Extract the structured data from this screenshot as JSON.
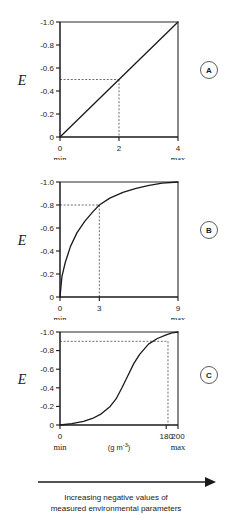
{
  "figure": {
    "y_axis_label": "E",
    "panel_badges": [
      "A",
      "B",
      "C"
    ],
    "caption_line1": "Increasing negative values of",
    "caption_line2": "measured environmental parameters",
    "arrow_icon": "right-arrow-icon"
  },
  "chart_data": [
    {
      "type": "line",
      "panel": "A",
      "title": "",
      "xlabel": "",
      "ylabel": "E",
      "relationship": "linear",
      "x": [
        0,
        0.4,
        0.8,
        1.2,
        1.6,
        2.0,
        2.4,
        2.8,
        3.2,
        3.6,
        4.0
      ],
      "values": [
        0,
        -0.1,
        -0.2,
        -0.3,
        -0.4,
        -0.5,
        -0.6,
        -0.7,
        -0.8,
        -0.9,
        -1.0
      ],
      "xlim": [
        0,
        4
      ],
      "ylim": [
        0,
        -1.0
      ],
      "x_ticks": [
        0,
        2,
        4
      ],
      "x_tick_labels": [
        "0",
        "2",
        "4"
      ],
      "x_tick_sublabels": [
        "min",
        "",
        "max"
      ],
      "y_ticks": [
        0,
        -0.2,
        -0.4,
        -0.6,
        -0.8,
        -1.0
      ],
      "y_tick_labels": [
        "0",
        "-0.2",
        "-0.4",
        "-0.6",
        "-0.8",
        "-1.0"
      ],
      "guide_x": 2,
      "guide_y": -0.5,
      "grid": false,
      "legend": "none"
    },
    {
      "type": "line",
      "panel": "B",
      "title": "",
      "xlabel": "",
      "ylabel": "E",
      "relationship": "concave-saturating",
      "x": [
        0,
        0.15,
        0.4,
        0.8,
        1.3,
        1.9,
        2.5,
        3.0,
        3.8,
        4.8,
        5.8,
        6.8,
        7.8,
        9.0
      ],
      "values": [
        0,
        -0.18,
        -0.3,
        -0.44,
        -0.56,
        -0.66,
        -0.74,
        -0.8,
        -0.86,
        -0.91,
        -0.945,
        -0.97,
        -0.99,
        -1.0
      ],
      "xlim": [
        0,
        9
      ],
      "ylim": [
        0,
        -1.0
      ],
      "x_ticks": [
        0,
        3,
        9
      ],
      "x_tick_labels": [
        "0",
        "3",
        "9"
      ],
      "x_tick_sublabels": [
        "min",
        "",
        "max"
      ],
      "y_ticks": [
        0,
        -0.2,
        -0.4,
        -0.6,
        -0.8,
        -1.0
      ],
      "y_tick_labels": [
        "0",
        "-0.2",
        "-0.4",
        "-0.6",
        "-0.8",
        "-1.0"
      ],
      "guide_x": 3,
      "guide_y": -0.8,
      "grid": false,
      "legend": "none"
    },
    {
      "type": "line",
      "panel": "C",
      "title": "",
      "xlabel": "(g m-3)",
      "xlabel_base": "(g m",
      "xlabel_sup": "-3",
      "xlabel_tail": ")",
      "ylabel": "E",
      "relationship": "sigmoid",
      "x": [
        0,
        20,
        40,
        55,
        70,
        85,
        95,
        105,
        115,
        125,
        135,
        150,
        165,
        180,
        190,
        200
      ],
      "values": [
        0,
        -0.015,
        -0.04,
        -0.07,
        -0.12,
        -0.2,
        -0.28,
        -0.4,
        -0.53,
        -0.66,
        -0.76,
        -0.87,
        -0.93,
        -0.97,
        -0.99,
        -1.0
      ],
      "xlim": [
        0,
        200
      ],
      "ylim": [
        0,
        -1.0
      ],
      "x_ticks": [
        0,
        180,
        200
      ],
      "x_tick_labels": [
        "0",
        "180",
        "200"
      ],
      "x_tick_sublabels": [
        "min",
        "",
        "max"
      ],
      "y_ticks": [
        0,
        -0.2,
        -0.4,
        -0.6,
        -0.8,
        -1.0
      ],
      "y_tick_labels": [
        "0",
        "-0.2",
        "-0.4",
        "-0.6",
        "-0.8",
        "-1.0"
      ],
      "guide_x": 183,
      "guide_y": -0.9,
      "grid": false,
      "legend": "none"
    }
  ]
}
